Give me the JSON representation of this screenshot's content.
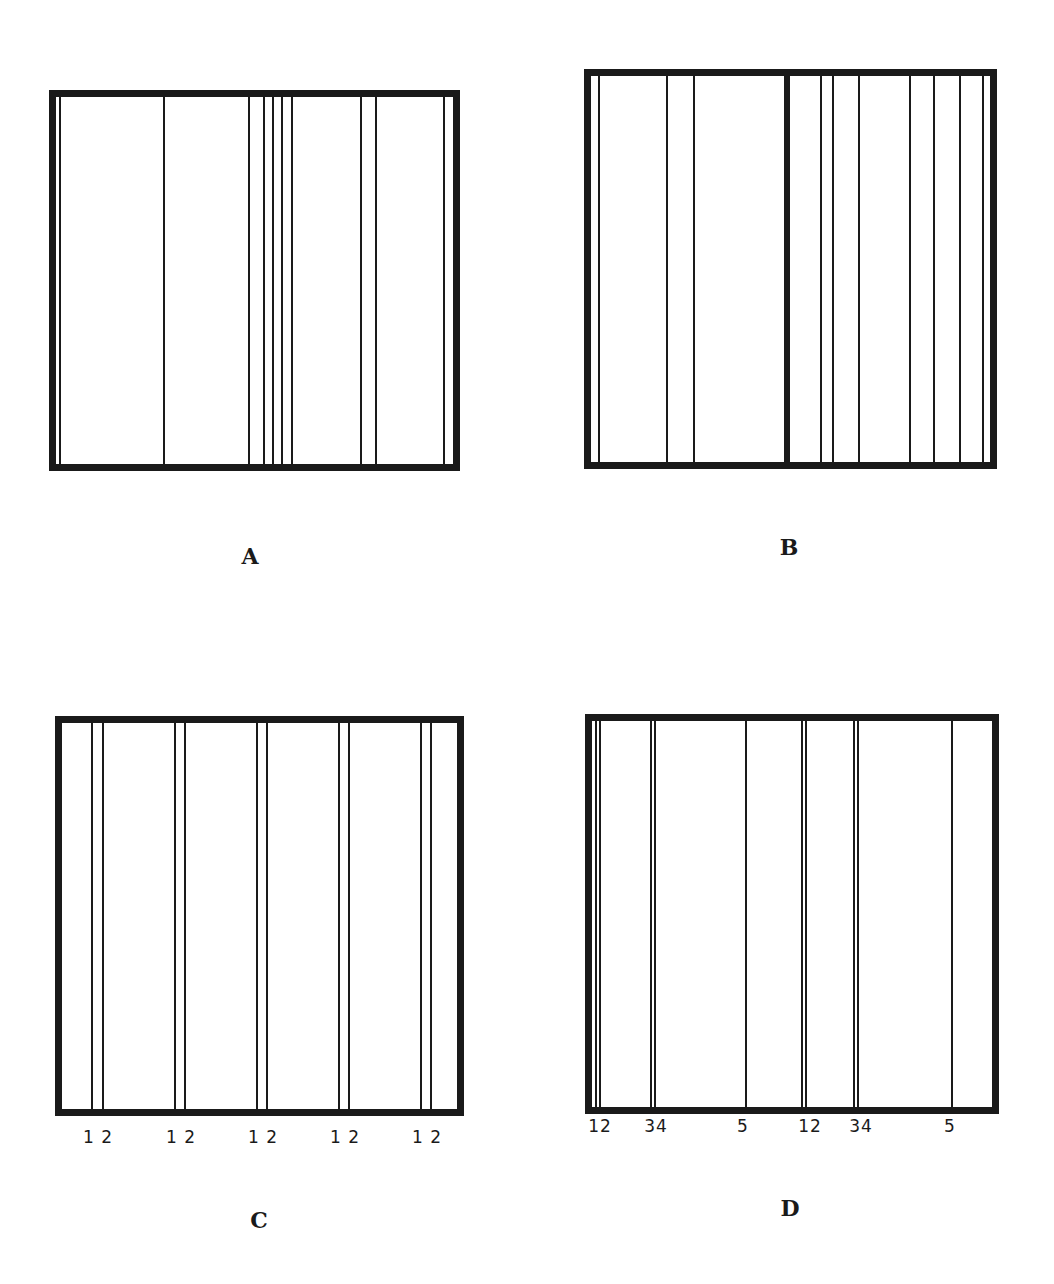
{
  "panels": [
    {
      "id": "A",
      "label": "A",
      "frame": {
        "left": 49,
        "top": 90,
        "width": 411,
        "height": 381
      },
      "lines": [
        60,
        164,
        249,
        264,
        273,
        282,
        292,
        361,
        376,
        444
      ],
      "thick_lines": [],
      "tick_labels": [],
      "label_pos": {
        "x": 250,
        "y": 556
      }
    },
    {
      "id": "B",
      "label": "B",
      "frame": {
        "left": 584,
        "top": 69,
        "width": 413,
        "height": 400
      },
      "lines": [
        599,
        667,
        694,
        821,
        833,
        859,
        910,
        934,
        960,
        983
      ],
      "thick_lines": [
        787
      ],
      "tick_labels": [],
      "label_pos": {
        "x": 789,
        "y": 547
      }
    },
    {
      "id": "C",
      "label": "C",
      "frame": {
        "left": 55,
        "top": 716,
        "width": 409,
        "height": 400
      },
      "lines": [
        92,
        103,
        175,
        185,
        257,
        267,
        339,
        349,
        421,
        431
      ],
      "thick_lines": [],
      "tick_labels": [
        {
          "text": "1 2",
          "x": 98,
          "y": 1127
        },
        {
          "text": "1 2",
          "x": 181,
          "y": 1127
        },
        {
          "text": "1 2",
          "x": 263,
          "y": 1127
        },
        {
          "text": "1 2",
          "x": 345,
          "y": 1127
        },
        {
          "text": "1 2",
          "x": 427,
          "y": 1127
        }
      ],
      "label_pos": {
        "x": 259,
        "y": 1220
      }
    },
    {
      "id": "D",
      "label": "D",
      "frame": {
        "left": 585,
        "top": 714,
        "width": 414,
        "height": 400
      },
      "lines": [
        596,
        600,
        651,
        655,
        746,
        802,
        806,
        854,
        858,
        952
      ],
      "thick_lines": [],
      "tick_labels": [
        {
          "text": "12",
          "x": 600,
          "y": 1116
        },
        {
          "text": "34",
          "x": 656,
          "y": 1116
        },
        {
          "text": "5",
          "x": 743,
          "y": 1116
        },
        {
          "text": "12",
          "x": 810,
          "y": 1116
        },
        {
          "text": "34",
          "x": 861,
          "y": 1116
        },
        {
          "text": "5",
          "x": 950,
          "y": 1116
        }
      ],
      "label_pos": {
        "x": 790,
        "y": 1208
      }
    }
  ],
  "colors": {
    "ink": "#1a1a1a",
    "background": "#ffffff"
  }
}
